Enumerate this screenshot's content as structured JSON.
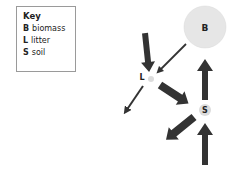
{
  "key": {
    "title": "Key",
    "items": [
      {
        "symbol": "B",
        "label": "biomass"
      },
      {
        "symbol": "L",
        "label": "litter"
      },
      {
        "symbol": "S",
        "label": "soil"
      }
    ]
  },
  "nodes": {
    "biomass": {
      "label": "B",
      "size": "large",
      "color": "#e6e6e6"
    },
    "litter": {
      "label": "L",
      "size": "tiny",
      "color": "#dcdcdc"
    },
    "soil": {
      "label": "S",
      "size": "small",
      "color": "#dcdcdc"
    }
  },
  "flows": [
    {
      "from": "input",
      "to": "litter",
      "weight": "thick"
    },
    {
      "from": "biomass",
      "to": "litter",
      "weight": "thin"
    },
    {
      "from": "litter",
      "to": "output",
      "weight": "thin"
    },
    {
      "from": "litter",
      "to": "soil",
      "weight": "thick"
    },
    {
      "from": "soil",
      "to": "biomass",
      "weight": "thick"
    },
    {
      "from": "soil",
      "to": "output",
      "weight": "thick"
    },
    {
      "from": "input",
      "to": "soil",
      "weight": "thick"
    }
  ],
  "colors": {
    "arrow": "#333333",
    "node_fill": "#e6e6e6"
  }
}
